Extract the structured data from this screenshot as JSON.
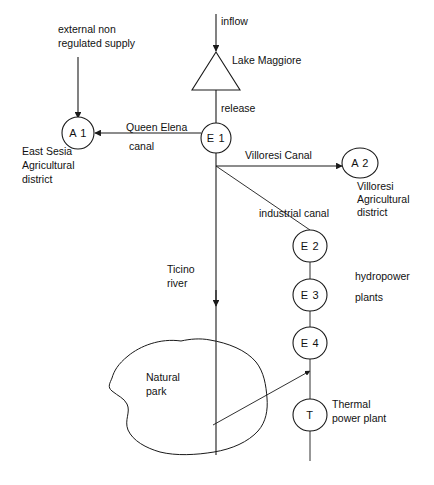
{
  "diagram": {
    "nodes": [
      {
        "id": "lake",
        "label": "Lake Maggiore",
        "shape": "triangle",
        "name_label": "Lake Maggiore"
      },
      {
        "id": "E1",
        "label": "E 1",
        "shape": "circle"
      },
      {
        "id": "A1",
        "label": "A 1",
        "shape": "circle"
      },
      {
        "id": "A2",
        "label": "A 2",
        "shape": "circle"
      },
      {
        "id": "E2",
        "label": "E 2",
        "shape": "circle"
      },
      {
        "id": "E3",
        "label": "E 3",
        "shape": "circle"
      },
      {
        "id": "E4",
        "label": "E 4",
        "shape": "circle"
      },
      {
        "id": "T",
        "label": "T",
        "shape": "circle"
      },
      {
        "id": "park",
        "label": "Natural park",
        "shape": "blob"
      }
    ],
    "labels": {
      "external_supply_line1": "external non",
      "external_supply_line2": "regulated supply",
      "inflow": "inflow",
      "lake_maggiore": "Lake Maggiore",
      "release": "release",
      "queen_elena_line1": "Queen Elena",
      "queen_elena_line2": "canal",
      "east_sesia_line1": "East Sesia",
      "east_sesia_line2": "Agricultural",
      "east_sesia_line3": "district",
      "villoresi_canal": "Villoresi Canal",
      "villoresi_district_line1": "Villoresi",
      "villoresi_district_line2": "Agricultural",
      "villoresi_district_line3": "district",
      "industrial_canal": "industrial canal",
      "hydropower_line1": "hydropower",
      "hydropower_line2": "plants",
      "ticino_line1": "Ticino",
      "ticino_line2": "river",
      "natural_park_line1": "Natural",
      "natural_park_line2": "park",
      "thermal_line1": "Thermal",
      "thermal_line2": "power plant"
    },
    "node_labels": {
      "E1": "E 1",
      "A1": "A 1",
      "A2": "A 2",
      "E2": "E 2",
      "E3": "E 3",
      "E4": "E 4",
      "T": "T"
    },
    "colors": {
      "stroke": "#1a1a1a",
      "text": "#111111",
      "background": "#ffffff"
    }
  }
}
